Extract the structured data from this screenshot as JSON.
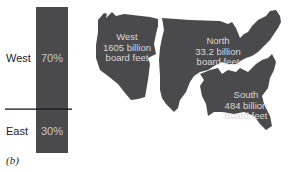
{
  "chart_data": [
    {
      "type": "bar",
      "title": "",
      "stacked": true,
      "categories": [
        "West",
        "East"
      ],
      "values": [
        70,
        30
      ],
      "value_labels": [
        "70%",
        "30%"
      ],
      "units": "percent",
      "ylim": [
        0,
        100
      ],
      "colors": {
        "bar": "#4a4a4c",
        "divider": "#111111",
        "label_text": "#c8c8c8"
      }
    },
    {
      "type": "map",
      "title": "",
      "regions": [
        {
          "name": "West",
          "value": 1605,
          "lines": [
            "West",
            "1605 billion",
            "board feet"
          ]
        },
        {
          "name": "North",
          "value": 33.2,
          "lines": [
            "North",
            "33.2 billion",
            "board feet"
          ]
        },
        {
          "name": "South",
          "value": 484,
          "lines": [
            "South",
            "484 billion",
            "board feet"
          ]
        }
      ],
      "units": "billion board feet",
      "colors": {
        "region_fill": "#4a4a4c",
        "label_text": "#d8d8d8"
      }
    }
  ],
  "caption": "(b)"
}
